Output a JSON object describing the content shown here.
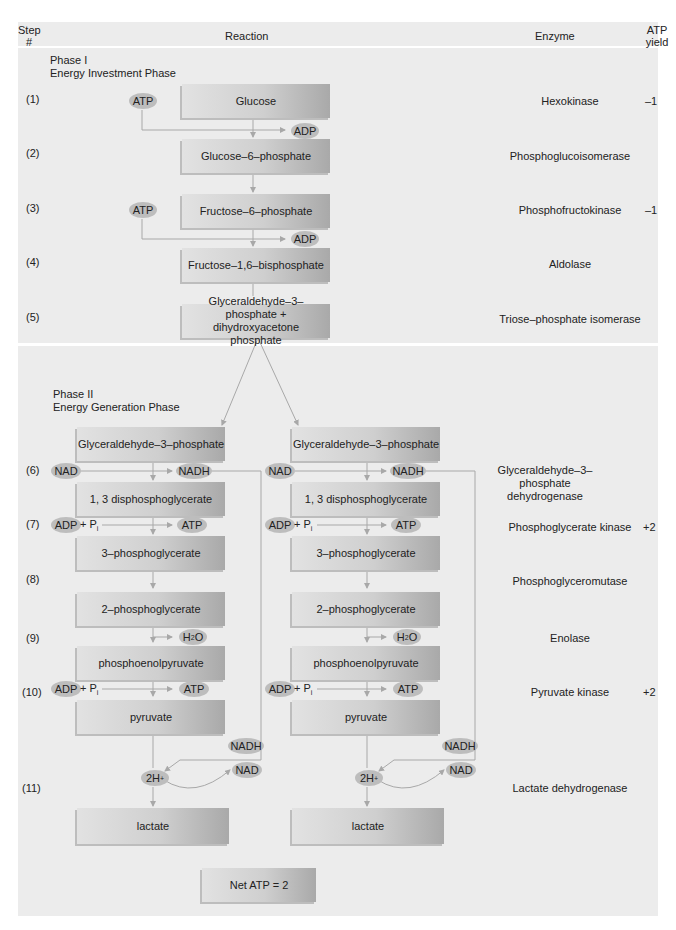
{
  "header": {
    "step_col": "Step #",
    "reaction_col": "Reaction",
    "enzyme_col": "Enzyme",
    "atp_col": "ATP yield"
  },
  "phase1": {
    "title": "Phase I",
    "subtitle": "Energy Investment Phase"
  },
  "phase2": {
    "title": "Phase II",
    "subtitle": "Energy Generation Phase"
  },
  "steps": [
    {
      "num": "(1)",
      "enzyme": "Hexokinase",
      "atp": "–1"
    },
    {
      "num": "(2)",
      "enzyme": "Phosphoglucoisomerase",
      "atp": ""
    },
    {
      "num": "(3)",
      "enzyme": "Phosphofructokinase",
      "atp": "–1"
    },
    {
      "num": "(4)",
      "enzyme": "Aldolase",
      "atp": ""
    },
    {
      "num": "(5)",
      "enzyme": "Triose–phosphate isomerase",
      "atp": ""
    },
    {
      "num": "(6)",
      "enzyme": "Glyceraldehyde–3–phosphate dehydrogenase",
      "atp": ""
    },
    {
      "num": "(7)",
      "enzyme": "Phosphoglycerate kinase",
      "atp": "+2"
    },
    {
      "num": "(8)",
      "enzyme": "Phosphoglyceromutase",
      "atp": ""
    },
    {
      "num": "(9)",
      "enzyme": "Enolase",
      "atp": ""
    },
    {
      "num": "(10)",
      "enzyme": "Pyruvate kinase",
      "atp": "+2"
    },
    {
      "num": "(11)",
      "enzyme": "Lactate dehydrogenase",
      "atp": ""
    }
  ],
  "phase1_boxes": [
    "Glucose",
    "Glucose–6–phosphate",
    "Fructose–6–phosphate",
    "Fructose–1,6–bisphosphate",
    "Glyceraldehyde–3–phosphate + dihydroxyacetone phosphate"
  ],
  "phase2_boxes": [
    "Glyceraldehyde–3–phosphate",
    "1, 3 disphosphoglycerate",
    "3–phosphoglycerate",
    "2–phosphoglycerate",
    "phosphoenolpyruvate",
    "pyruvate",
    "lactate"
  ],
  "cofactors": {
    "atp": "ATP",
    "adp": "ADP",
    "nad": "NAD",
    "nadh": "NADH",
    "pi": "+ P",
    "pi_sub": "i",
    "h2o_h": "H",
    "h2o_sub": "2",
    "h2o_o": "O",
    "two_h": "2H",
    "two_h_sup": "+"
  },
  "net_atp": "Net ATP = 2",
  "colors": {
    "panel": "#ececec",
    "box_light": "#e2e2e2",
    "box_dark": "#a9a9a9",
    "pill": "#bdbdbd",
    "line": "#a8a8a8"
  }
}
